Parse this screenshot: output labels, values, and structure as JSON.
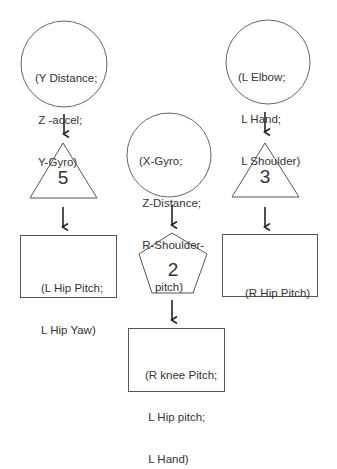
{
  "diagram": {
    "columns": [
      {
        "id": "left",
        "input_circle": {
          "lines": [
            "(Y Distance;",
            " Z -accel;",
            " Y-Gyro)"
          ]
        },
        "cluster_shape": "triangle",
        "cluster_number": "5",
        "output_box": {
          "lines": [
            "(L Hip Pitch;",
            "L Hip Yaw)"
          ]
        }
      },
      {
        "id": "middle",
        "input_circle": {
          "lines": [
            "(X-Gyro;",
            " Z-Distance;",
            " R-Shoulder-",
            "     pitch)"
          ]
        },
        "cluster_shape": "pentagon",
        "cluster_number": "2",
        "output_box": {
          "lines": [
            "(R knee Pitch;",
            " L Hip pitch;",
            " L Hand)"
          ]
        }
      },
      {
        "id": "right",
        "input_circle": {
          "lines": [
            "(L Elbow;",
            " L Hand;",
            " L Shoulder)"
          ]
        },
        "cluster_shape": "triangle",
        "cluster_number": "3",
        "output_box": {
          "lines": [
            "(R Hip Pitch)"
          ]
        }
      }
    ],
    "colors": {
      "stroke": "#555555",
      "arrow": "#222222",
      "text": "#333333",
      "background": "#ffffff"
    }
  }
}
